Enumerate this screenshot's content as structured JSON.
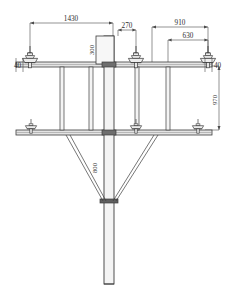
{
  "drawing": {
    "title": "Utility pole crossarm assembly elevation",
    "type": "engineering-elevation",
    "units": "mm",
    "line_color": "#3c3c3c",
    "fill_color": "#f2f2f2",
    "text_color": "#2b2b2b",
    "background": "#ffffff"
  },
  "dimensions": {
    "span_left_total": "1430",
    "offset_center": "270",
    "span_right_total": "910",
    "span_right_inner": "630",
    "box_height": "300",
    "arm_end_left": "40",
    "arm_end_right": "40",
    "arm_vertical_gap": "970",
    "brace_height": "800"
  },
  "components": {
    "pole_label": "center-pole",
    "upper_crossarm_label": "upper-crossarm",
    "lower_crossarm_label": "lower-crossarm",
    "insulator_count_upper": 3,
    "insulator_count_lower": 3,
    "brace_count_vertical": 4,
    "brace_count_diagonal": 4
  }
}
